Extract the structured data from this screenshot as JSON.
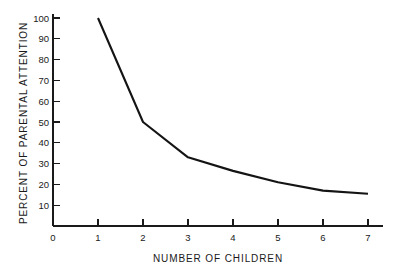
{
  "chart_data": {
    "type": "line",
    "title": "",
    "xlabel": "NUMBER OF CHILDREN",
    "ylabel": "PERCENT OF PARENTAL ATTENTION",
    "x": [
      1,
      2,
      3,
      4,
      5,
      6,
      7
    ],
    "values": [
      100,
      50,
      33,
      26.5,
      21,
      17,
      15.5
    ],
    "series": [
      {
        "name": "Percent of parental attention",
        "x": [
          1,
          2,
          3,
          4,
          5,
          6,
          7
        ],
        "values": [
          100,
          50,
          33,
          26.5,
          21,
          17,
          15.5
        ]
      }
    ],
    "xlim": [
      0,
      7.35
    ],
    "ylim": [
      0,
      104
    ],
    "xticks": [
      0,
      1,
      2,
      3,
      4,
      5,
      6,
      7
    ],
    "xticklabels": [
      "0",
      "1",
      "2",
      "3",
      "4",
      "5",
      "6",
      "7"
    ],
    "yticks": [
      0,
      10,
      20,
      30,
      40,
      50,
      60,
      70,
      80,
      90,
      100
    ],
    "yticklabels": [
      "0",
      "10",
      "20",
      "30",
      "40",
      "50",
      "60",
      "70",
      "80",
      "90",
      "100"
    ],
    "grid": false,
    "legend": false,
    "legend_position": "none",
    "line_color": "#141414",
    "axis_color": "#1a1a1a",
    "background_color": "#ffffff",
    "annotations": []
  }
}
